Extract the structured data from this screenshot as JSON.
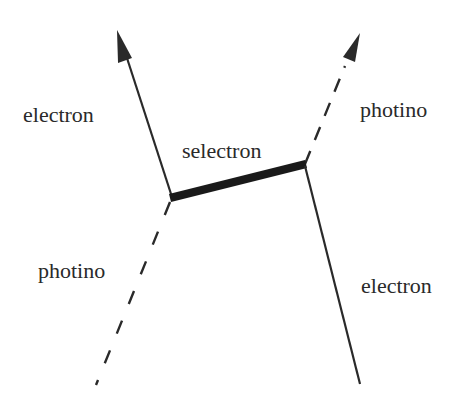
{
  "diagram": {
    "type": "feynman-diagram",
    "labels": {
      "electron_out": "electron",
      "photino_out": "photino",
      "propagator": "selectron",
      "photino_in": "photino",
      "electron_in": "electron"
    },
    "colors": {
      "line": "#2a2a2a",
      "background": "#ffffff"
    },
    "lines": [
      {
        "name": "electron-outgoing",
        "style": "solid-arrow",
        "from": [
          172,
          197
        ],
        "to": [
          118,
          30
        ]
      },
      {
        "name": "selectron-propagator",
        "style": "thick-solid",
        "from": [
          172,
          197
        ],
        "to": [
          305,
          164
        ]
      },
      {
        "name": "photino-outgoing",
        "style": "dashed-arrow",
        "from": [
          305,
          164
        ],
        "to": [
          358,
          34
        ]
      },
      {
        "name": "photino-incoming",
        "style": "dashed",
        "from": [
          172,
          197
        ],
        "to": [
          96,
          385
        ]
      },
      {
        "name": "electron-incoming",
        "style": "solid",
        "from": [
          305,
          164
        ],
        "to": [
          360,
          384
        ]
      }
    ]
  }
}
